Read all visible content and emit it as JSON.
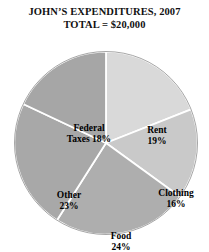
{
  "title": {
    "line1": "JOHN’S EXPENDITURES, 2007",
    "line2": "TOTAL = $20,000"
  },
  "chart_data": {
    "type": "pie",
    "title": "JOHN’S EXPENDITURES, 2007",
    "subtitle": "TOTAL = $20,000",
    "total_label": "TOTAL = $20,000",
    "total_value": 20000,
    "currency": "$",
    "units": "percent",
    "start_angle_deg": 0,
    "direction": "clockwise",
    "legend": "none",
    "grid": false,
    "categories": [
      "Rent",
      "Clothing",
      "Food",
      "Other",
      "Federal Taxes"
    ],
    "values": [
      19,
      16,
      24,
      23,
      18
    ],
    "slices": [
      {
        "name": "Rent",
        "value": 19,
        "label_name": "Rent",
        "label_pct": "19%",
        "color": "#d9d9d9",
        "label_layout": "stacked"
      },
      {
        "name": "Clothing",
        "value": 16,
        "label_name": "Clothing",
        "label_pct": "16%",
        "color": "#c9c9c9",
        "label_layout": "stacked"
      },
      {
        "name": "Food",
        "value": 24,
        "label_name": "Food",
        "label_pct": "24%",
        "color": "#aeaeae",
        "label_layout": "stacked"
      },
      {
        "name": "Other",
        "value": 23,
        "label_name": "Other",
        "label_pct": "23%",
        "color": "#a8a8a8",
        "label_layout": "stacked"
      },
      {
        "name": "Federal Taxes",
        "value": 18,
        "label_name": "Federal",
        "label_pct": "Taxes 18%",
        "color": "#a6a6a6",
        "label_layout": "stacked"
      }
    ],
    "separator_color": "#ffffff",
    "background_color": "#ffffff"
  }
}
